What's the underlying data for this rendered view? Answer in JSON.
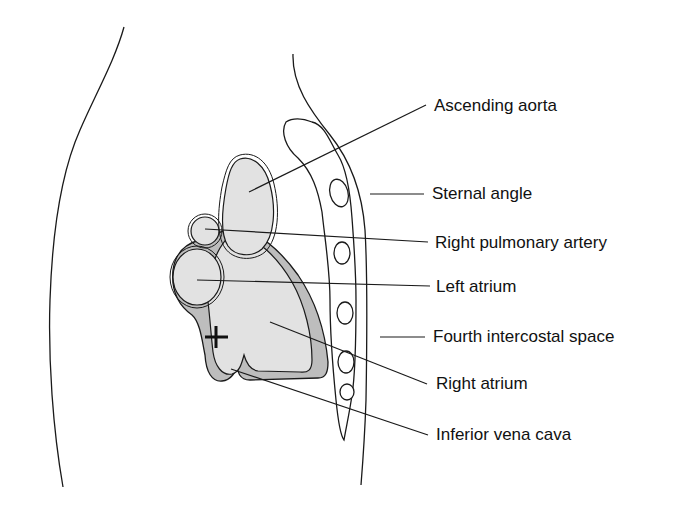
{
  "diagram": {
    "type": "anatomical-illustration",
    "labels": [
      {
        "id": "ascending-aorta",
        "text": "Ascending aorta",
        "x": 434,
        "y": 96
      },
      {
        "id": "sternal-angle",
        "text": "Sternal angle",
        "x": 432,
        "y": 186
      },
      {
        "id": "right-pulmonary-artery",
        "text": "Right pulmonary artery",
        "x": 435,
        "y": 234
      },
      {
        "id": "left-atrium",
        "text": "Left atrium",
        "x": 436,
        "y": 277
      },
      {
        "id": "fourth-intercostal-space",
        "text": "Fourth intercostal space",
        "x": 433,
        "y": 327
      },
      {
        "id": "right-atrium",
        "text": "Right atrium",
        "x": 436,
        "y": 374
      },
      {
        "id": "inferior-vena-cava",
        "text": "Inferior vena cava",
        "x": 436,
        "y": 426
      }
    ],
    "marker": {
      "symbol": "+"
    },
    "colors": {
      "stroke": "#1a1a1a",
      "chamber_fill": "#e2e2e2",
      "pericardium_fill": "#bdbdbd",
      "background": "#ffffff"
    }
  }
}
